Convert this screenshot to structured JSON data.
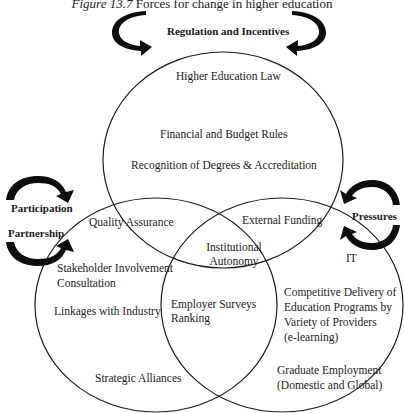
{
  "figure": {
    "number": "Figure 13.7",
    "title": "Forces for change in higher education"
  },
  "forces": {
    "top": "Regulation and Incentives",
    "left_upper": "Participation",
    "left_lower": "Partnership",
    "right": "Pressures"
  },
  "circles": {
    "top": {
      "items": [
        "Higher Education Law",
        "Financial and Budget Rules",
        "Recognition of Degrees & Accreditation"
      ]
    },
    "left": {
      "items": [
        "Stakeholder Involvement",
        "Consultation",
        "Linkages with Industry",
        "Strategic Alliances"
      ]
    },
    "right": {
      "items": [
        "IT",
        "Competitive Delivery of",
        "Education Programs by",
        "Variety of Providers",
        "(e-learning)",
        "Graduate Employment",
        "(Domestic and Global)"
      ]
    }
  },
  "overlaps": {
    "top_left": "Quality Assurance",
    "top_right": "External Funding",
    "left_right": [
      "Employer Surveys",
      "Ranking"
    ],
    "all_three": [
      "Institutional",
      "Autonomy"
    ]
  },
  "colors": {
    "line": "#1a1a1a",
    "arrow": "#0d0d0d",
    "background": "#ffffff"
  }
}
